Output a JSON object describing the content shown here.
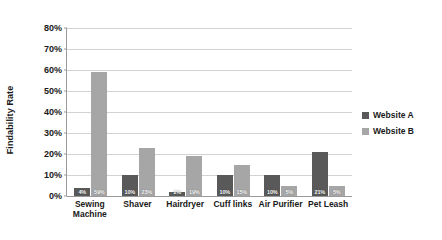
{
  "chart_data": {
    "type": "bar",
    "title": "",
    "xlabel": "",
    "ylabel": "Findability Rate",
    "ylim": [
      0,
      80
    ],
    "ytick_labels": [
      "80%",
      "70%",
      "60%",
      "50%",
      "40%",
      "30%",
      "20%",
      "10%",
      "0%"
    ],
    "ytick_values": [
      80,
      70,
      60,
      50,
      40,
      30,
      20,
      10,
      0
    ],
    "grid": true,
    "legend_position": "right",
    "categories": [
      "Sewing\nMachine",
      "Shaver",
      "Hairdryer",
      "Cuff links",
      "Air Purifier",
      "Pet Leash"
    ],
    "series": [
      {
        "name": "Website A",
        "color": "#595959",
        "values": [
          4,
          10,
          2,
          10,
          10,
          21
        ],
        "value_labels": [
          "4%",
          "10%",
          "2%",
          "10%",
          "10%",
          "21%"
        ]
      },
      {
        "name": "Website B",
        "color": "#a6a6a6",
        "values": [
          59,
          23,
          19,
          15,
          5,
          5
        ],
        "value_labels": [
          "59%",
          "23%",
          "19%",
          "15%",
          "5%",
          "5%"
        ]
      }
    ]
  },
  "legend": {
    "items": [
      {
        "label": "Website A"
      },
      {
        "label": "Website B"
      }
    ]
  }
}
